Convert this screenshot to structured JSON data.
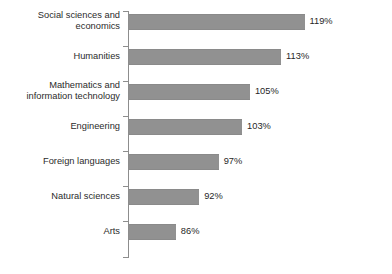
{
  "chart_data": {
    "type": "bar",
    "orientation": "horizontal",
    "title": "",
    "subtitle": "",
    "xlabel": "",
    "ylabel": "",
    "legend": [],
    "grid": false,
    "value_suffix": "%",
    "categories": [
      "Social sciences and economics",
      "Humanities",
      "Mathematics and information technology",
      "Engineering",
      "Foreign languages",
      "Natural sciences",
      "Arts"
    ],
    "values": [
      119,
      113,
      105,
      103,
      97,
      92,
      86
    ],
    "value_labels": [
      "119%",
      "113%",
      "105%",
      "103%",
      "97%",
      "92%",
      "86%"
    ],
    "xlim": [
      74,
      126
    ],
    "bar_color": "#919191",
    "axis_color": "#8d8d8d",
    "label_color": "#2b2b2b",
    "background": "#ffffff"
  },
  "rows": [
    {
      "label_line1": "Social sciences and",
      "label_line2": "economics",
      "label_full": "Social sciences and economics",
      "value_label": "119%",
      "value": 119
    },
    {
      "label_line1": "Humanities",
      "label_line2": "",
      "label_full": "Humanities",
      "value_label": "113%",
      "value": 113
    },
    {
      "label_line1": "Mathematics and",
      "label_line2": "information technology",
      "label_full": "Mathematics and information technology",
      "value_label": "105%",
      "value": 105
    },
    {
      "label_line1": "Engineering",
      "label_line2": "",
      "label_full": "Engineering",
      "value_label": "103%",
      "value": 103
    },
    {
      "label_line1": "Foreign languages",
      "label_line2": "",
      "label_full": "Foreign languages",
      "value_label": "97%",
      "value": 97
    },
    {
      "label_line1": "Natural sciences",
      "label_line2": "",
      "label_full": "Natural sciences",
      "value_label": "92%",
      "value": 92
    },
    {
      "label_line1": "Arts",
      "label_line2": "",
      "label_full": "Arts",
      "value_label": "86%",
      "value": 86
    }
  ]
}
